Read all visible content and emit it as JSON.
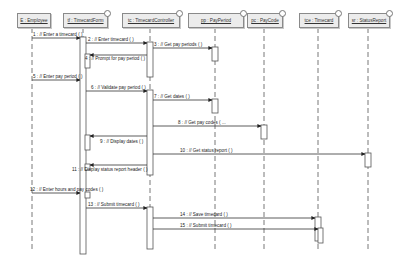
{
  "diagram": {
    "type": "UML sequence diagram",
    "lifelines": [
      {
        "id": "employee",
        "label": "E : Employee",
        "x": 32,
        "box_x": 17,
        "box_w": 32
      },
      {
        "id": "timecardform",
        "label": "tf : TimecardForm",
        "x": 83,
        "box_x": 63,
        "box_w": 43
      },
      {
        "id": "timecardcontroller",
        "label": "tc : TimecardController",
        "x": 150,
        "box_x": 122,
        "box_w": 56
      },
      {
        "id": "payperiod",
        "label": "pp : PayPeriod",
        "x": 215,
        "box_x": 188,
        "box_w": 54
      },
      {
        "id": "paycode",
        "label": "pc : PayCode",
        "x": 264,
        "box_x": 247,
        "box_w": 34
      },
      {
        "id": "timecard",
        "label": "tce : Timecard",
        "x": 318,
        "box_x": 299,
        "box_w": 38
      },
      {
        "id": "statusreport",
        "label": "sr : StatusReport",
        "x": 368,
        "box_x": 348,
        "box_w": 40
      }
    ],
    "messages": [
      {
        "n": 1,
        "label": "1 : // Enter a timecard ( )",
        "from": "employee",
        "to": "timecardform",
        "y": 38
      },
      {
        "n": 2,
        "label": "2 : // Enter timecard ( )",
        "from": "timecardform",
        "to": "timecardcontroller",
        "y": 43
      },
      {
        "n": 3,
        "label": "3 : // Get pay periods ( )",
        "from": "timecardcontroller",
        "to": "payperiod",
        "y": 48
      },
      {
        "n": 4,
        "label": "4 : // Prompt for pay period ( )",
        "from": "timecardcontroller",
        "to": "timecardform",
        "y": 55
      },
      {
        "n": 5,
        "label": "5 : // Enter pay period ( )",
        "from": "employee",
        "to": "timecardform",
        "y": 80
      },
      {
        "n": 6,
        "label": "6 : // Validate pay period ( )",
        "from": "timecardform",
        "to": "timecardcontroller",
        "y": 91
      },
      {
        "n": 7,
        "label": "7 : // Get dates ( )",
        "from": "timecardcontroller",
        "to": "payperiod",
        "y": 100
      },
      {
        "n": 8,
        "label": "8 : // Get pay codes ( ...",
        "from": "timecardcontroller",
        "to": "paycode",
        "y": 126
      },
      {
        "n": 9,
        "label": "9 : // Display dates ( )",
        "from": "timecardcontroller",
        "to": "timecardform",
        "y": 136
      },
      {
        "n": 10,
        "label": "10 : // Get status report ( )",
        "from": "timecardcontroller",
        "to": "statusreport",
        "y": 154
      },
      {
        "n": 11,
        "label": "11 : // Display status report header ( )",
        "from": "timecardcontroller",
        "to": "timecardform",
        "y": 165
      },
      {
        "n": 12,
        "label": "12 : // Enter hours and pay codes ( )",
        "from": "employee",
        "to": "timecardform",
        "y": 193
      },
      {
        "n": 13,
        "label": "13 : // Submit timecard ( )",
        "from": "timecardform",
        "to": "timecardcontroller",
        "y": 208
      },
      {
        "n": 14,
        "label": "14 : // Save timecard ( )",
        "from": "timecardcontroller",
        "to": "timecard",
        "y": 218
      },
      {
        "n": 15,
        "label": "15 : // Submit timecard ( )",
        "from": "timecardcontroller",
        "to": "timecard",
        "y": 229
      }
    ],
    "colors": {
      "line": "#555555",
      "box_fill": "#ececec",
      "box_border": "#8a8a8a",
      "activation_fill": "#ffffff"
    }
  }
}
